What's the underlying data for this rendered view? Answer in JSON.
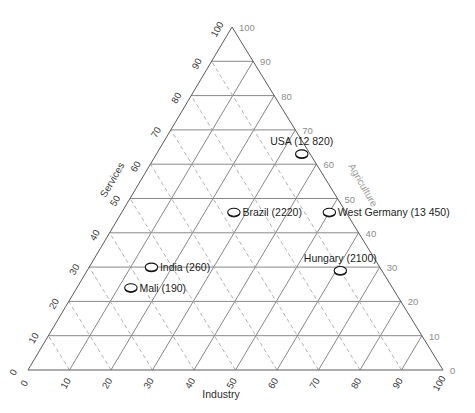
{
  "chart_data": {
    "type": "scatter",
    "plot_kind": "ternary-diagram",
    "title": "",
    "axes": {
      "bottom": {
        "label": "Industry",
        "ticks": [
          0,
          10,
          20,
          30,
          40,
          50,
          60,
          70,
          80,
          90,
          100
        ],
        "direction": "left-to-right",
        "label_color": "#2d2d2d"
      },
      "left": {
        "label": "Services",
        "ticks": [
          0,
          10,
          20,
          30,
          40,
          50,
          60,
          70,
          80,
          90,
          100
        ],
        "direction": "bottom-to-top",
        "label_color": "#3a3a3a"
      },
      "right": {
        "label": "Agriculture",
        "ticks": [
          0,
          10,
          20,
          30,
          40,
          50,
          60,
          70,
          80,
          90,
          100
        ],
        "direction": "bottom-to-top",
        "label_color": "#9a9a9a"
      }
    },
    "grid": {
      "horizontal": "solid",
      "left_parallel": "solid",
      "right_parallel": "dashed",
      "interval": 10
    },
    "legend": {
      "visible": false
    },
    "points": [
      {
        "name": "Mali",
        "value": "190",
        "label": "Mali (190)",
        "industry": 13,
        "services": 24,
        "agriculture": 63,
        "label_side": "right"
      },
      {
        "name": "India",
        "value": "260",
        "label": "India (260)",
        "industry": 15,
        "services": 30,
        "agriculture": 55,
        "label_side": "right"
      },
      {
        "name": "Brazil",
        "value": "2220",
        "label": "Brazil (2220)",
        "industry": 27,
        "services": 46,
        "agriculture": 27,
        "label_side": "right"
      },
      {
        "name": "Hungary",
        "value": "2100",
        "label": "Hungary (2100)",
        "industry": 61,
        "services": 29,
        "agriculture": 10,
        "label_side": "above"
      },
      {
        "name": "USA",
        "value": "12 820",
        "label": "USA (12 820)",
        "industry": 35,
        "services": 63,
        "agriculture": 2,
        "label_side": "above"
      },
      {
        "name": "West Germany",
        "value": "13 450",
        "label": "West Germany (13 450)",
        "industry": 50,
        "services": 46,
        "agriculture": 4,
        "label_side": "right"
      }
    ]
  },
  "colors": {
    "background": "#ffffff",
    "edge": "#5a5a5a",
    "grid_solid": "#7a7a7a",
    "grid_dashed": "#a8a8a8",
    "tick_dark": "#333333",
    "tick_gray": "#8d8d8d",
    "marker_fill": "#ffffff",
    "marker_stroke": "#111111"
  }
}
